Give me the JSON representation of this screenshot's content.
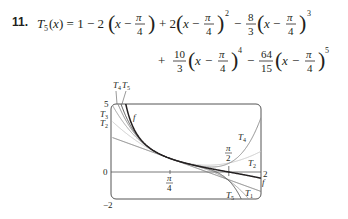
{
  "exercise": {
    "number": "11.",
    "line1": "T₅(x) = 1 − 2(x − π/4) + 2(x − π/4)² − 8/3 (x − π/4)³",
    "line2": "+ 10/3 (x − π/4)⁴ − 64/15 (x − π/4)⁵"
  },
  "chart_data": {
    "type": "line",
    "title": "",
    "function": "f(x) = cot x",
    "series": [
      {
        "name": "f",
        "expr": "cot(x)",
        "color": "#231f20"
      },
      {
        "name": "T1",
        "coeffs": [
          1,
          -2
        ],
        "color": "#7a7a7a"
      },
      {
        "name": "T2",
        "coeffs": [
          1,
          -2,
          2
        ],
        "color": "#c8c8c8"
      },
      {
        "name": "T3",
        "coeffs": [
          1,
          -2,
          2,
          -2.6667
        ],
        "color": "#a0a0a0"
      },
      {
        "name": "T4",
        "coeffs": [
          1,
          -2,
          2,
          -2.6667,
          3.3333
        ],
        "color": "#8c8c8c"
      },
      {
        "name": "T5",
        "coeffs": [
          1,
          -2,
          2,
          -2.6667,
          3.3333,
          -4.2667
        ],
        "color": "#5a5a5a"
      }
    ],
    "center": "π/4",
    "xlim": [
      0,
      2
    ],
    "ylim": [
      -2,
      5
    ],
    "x_ticks": [
      "π/4",
      "π/2",
      "2"
    ],
    "y_ticks": [
      "5",
      "0",
      "−2"
    ],
    "labels": {
      "y5": "5",
      "y0": "0",
      "ym2": "−2",
      "x2": "2",
      "pi": "π",
      "four": "4",
      "two": "2",
      "T1": "T",
      "T1s": "1",
      "T2": "T",
      "T2s": "2",
      "T3": "T",
      "T3s": "3",
      "T4": "T",
      "T4s": "4",
      "T5": "T",
      "T5s": "5",
      "f": "f"
    }
  }
}
